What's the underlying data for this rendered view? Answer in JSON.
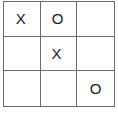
{
  "board": {
    "title": "tic-tac-toe-grid",
    "rows": 3,
    "columns": 3,
    "colors": {
      "background": "#ffffff",
      "gridline": "#6b6b6b",
      "mark": "#1a1a1a"
    },
    "cells": [
      [
        {
          "name": "cell-r1c1",
          "value": "X"
        },
        {
          "name": "cell-r1c2",
          "value": "O"
        },
        {
          "name": "cell-r1c3",
          "value": ""
        }
      ],
      [
        {
          "name": "cell-r2c1",
          "value": ""
        },
        {
          "name": "cell-r2c2",
          "value": "X"
        },
        {
          "name": "cell-r2c3",
          "value": ""
        }
      ],
      [
        {
          "name": "cell-r3c1",
          "value": ""
        },
        {
          "name": "cell-r3c2",
          "value": ""
        },
        {
          "name": "cell-r3c3",
          "value": "O"
        }
      ]
    ]
  }
}
